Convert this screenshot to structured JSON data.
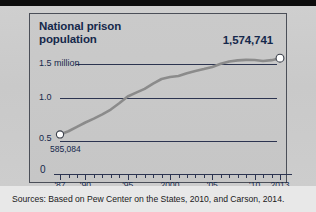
{
  "figure": {
    "title_line1": "National prison",
    "title_line2": "population",
    "end_value_label": "1,574,741",
    "start_value_label": "585,084",
    "source_note": "Sources: Based on Pew Center on the States, 2010, and Carson, 2014."
  },
  "colors": {
    "title_text": "#15284b",
    "gridline": "#2c3450",
    "series_line": "#8b8b8b",
    "marker_fill": "#ffffff",
    "marker_stroke": "#3a3f4a",
    "panel_bg": "#c8c8c8",
    "page_bg": "#d9d9d9",
    "top_bar": "#0d0d0d",
    "caption_bg": "#e8e8e8"
  },
  "chart_data": {
    "type": "line",
    "title": "National prison population",
    "xlabel": "",
    "ylabel": "",
    "ylim": [
      0,
      1.75
    ],
    "xlim": [
      1987,
      2013
    ],
    "grid": true,
    "legend": false,
    "y_unit": "millions",
    "y_ticks": [
      0,
      0.5,
      1.0,
      1.5
    ],
    "y_tick_labels": [
      "0",
      "0.5",
      "1.0",
      "1.5 million"
    ],
    "x_ticks": [
      1987,
      1990,
      1995,
      2000,
      2005,
      2010,
      2013
    ],
    "x_tick_labels": [
      "'87",
      "'90",
      "'95",
      "2000",
      "'05",
      "'10",
      "2013"
    ],
    "annotations": [
      {
        "text": "585,084",
        "x": 1987,
        "y": 0.585084
      },
      {
        "text": "1,574,741",
        "x": 2013,
        "y": 1.574741
      }
    ],
    "series": [
      {
        "name": "National prison population",
        "x": [
          1987,
          1988,
          1989,
          1990,
          1991,
          1992,
          1993,
          1994,
          1995,
          1996,
          1997,
          1998,
          1999,
          2000,
          2001,
          2002,
          2003,
          2004,
          2005,
          2006,
          2007,
          2008,
          2009,
          2010,
          2011,
          2012,
          2013
        ],
        "values": [
          0.585,
          0.627,
          0.683,
          0.74,
          0.79,
          0.846,
          0.909,
          0.99,
          1.078,
          1.128,
          1.177,
          1.246,
          1.305,
          1.331,
          1.345,
          1.38,
          1.409,
          1.434,
          1.462,
          1.504,
          1.532,
          1.547,
          1.553,
          1.552,
          1.538,
          1.55,
          1.575
        ]
      }
    ]
  },
  "x_tick_years": [
    1987,
    1988,
    1989,
    1990,
    1991,
    1992,
    1993,
    1994,
    1995,
    1996,
    1997,
    1998,
    1999,
    2000,
    2001,
    2002,
    2003,
    2004,
    2005,
    2006,
    2007,
    2008,
    2009,
    2010,
    2011,
    2012,
    2013
  ]
}
